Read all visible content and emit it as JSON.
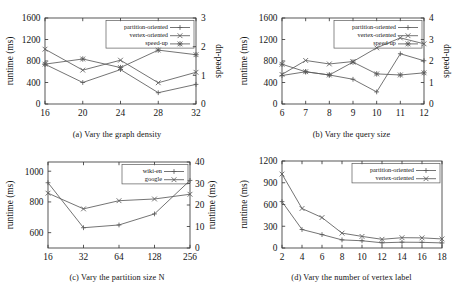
{
  "figure": {
    "panels": [
      "a",
      "b",
      "c",
      "d"
    ]
  },
  "chart_data": [
    {
      "id": "a",
      "type": "line",
      "title": "(a) Vary the graph density",
      "xlabel": "",
      "ylabel": "runtime (ms)",
      "y2label": "speed-up",
      "x": [
        16,
        20,
        24,
        28,
        32
      ],
      "xticklabels": [
        "16",
        "20",
        "24",
        "28",
        "32"
      ],
      "ylim": [
        0,
        1600
      ],
      "yticks": [
        0,
        400,
        800,
        1200,
        1600
      ],
      "yticklabels": [
        "0",
        "400",
        "800",
        "1200",
        "1600"
      ],
      "y2lim": [
        0,
        3
      ],
      "y2ticks": [
        0,
        1,
        2,
        3
      ],
      "y2ticklabels": [
        "0",
        "1",
        "2",
        "3"
      ],
      "grid": false,
      "legend_position": "top-right",
      "series": [
        {
          "name": "partition-oriented",
          "axis": "left",
          "marker": "plus",
          "values": [
            740,
            400,
            640,
            210,
            365
          ]
        },
        {
          "name": "vertex-oriented",
          "axis": "left",
          "marker": "cross",
          "values": [
            1020,
            630,
            815,
            395,
            590
          ]
        },
        {
          "name": "speed-up",
          "axis": "right",
          "marker": "star",
          "values": [
            1.39,
            1.57,
            1.27,
            1.88,
            1.72
          ]
        }
      ]
    },
    {
      "id": "b",
      "type": "line",
      "title": "(b) Vary the query size",
      "xlabel": "",
      "ylabel": "runtime (ms)",
      "y2label": "speed-up",
      "x": [
        6,
        7,
        8,
        9,
        10,
        11,
        12
      ],
      "xticklabels": [
        "6",
        "7",
        "8",
        "9",
        "10",
        "11",
        "12"
      ],
      "ylim": [
        0,
        1600
      ],
      "yticks": [
        0,
        400,
        800,
        1200,
        1600
      ],
      "yticklabels": [
        "0",
        "400",
        "800",
        "1200",
        "1600"
      ],
      "y2lim": [
        0,
        4
      ],
      "y2ticks": [
        0,
        1,
        2,
        3,
        4
      ],
      "y2ticklabels": [
        "0",
        "1",
        "2",
        "3",
        "4"
      ],
      "grid": false,
      "legend_position": "top-right",
      "series": [
        {
          "name": "partition-oriented",
          "axis": "left",
          "marker": "plus",
          "values": [
            530,
            600,
            540,
            460,
            225,
            935,
            805
          ]
        },
        {
          "name": "vertex-oriented",
          "axis": "left",
          "marker": "cross",
          "values": [
            550,
            810,
            745,
            790,
            1045,
            1230,
            1120
          ]
        },
        {
          "name": "speed-up",
          "axis": "right",
          "marker": "star",
          "values": [
            1.85,
            1.5,
            1.35,
            1.95,
            1.4,
            1.35,
            1.45
          ]
        }
      ]
    },
    {
      "id": "c",
      "type": "line",
      "title": "(c) Vary the partition size N",
      "xlabel": "",
      "ylabel": "runtime (ms)",
      "y2label": "runtime (ms)",
      "x": [
        16,
        32,
        64,
        128,
        256
      ],
      "xticklabels": [
        "16",
        "32",
        "64",
        "128",
        "256"
      ],
      "ylim": [
        500,
        1060
      ],
      "yticks": [
        600,
        800,
        1000
      ],
      "yticklabels": [
        "600",
        "800",
        "1000"
      ],
      "y2lim": [
        0,
        40
      ],
      "y2ticks": [
        0,
        10,
        20,
        30,
        40
      ],
      "y2ticklabels": [
        "0",
        "10",
        "20",
        "30",
        "40"
      ],
      "grid": false,
      "legend_position": "top-right",
      "series": [
        {
          "name": "wiki-en",
          "axis": "left",
          "marker": "plus",
          "values": [
            925,
            632,
            650,
            722,
            940
          ]
        },
        {
          "name": "google",
          "axis": "right",
          "marker": "cross",
          "values": [
            25.5,
            18.2,
            22.0,
            22.8,
            25.0
          ]
        }
      ]
    },
    {
      "id": "d",
      "type": "line",
      "title": "(d) Vary the number of vertex label",
      "xlabel": "",
      "ylabel": "runtime (ms)",
      "y2label": "",
      "x": [
        2,
        4,
        6,
        8,
        10,
        12,
        14,
        16,
        18
      ],
      "xticklabels": [
        "2",
        "4",
        "6",
        "8",
        "10",
        "12",
        "14",
        "16",
        "18"
      ],
      "ylim": [
        0,
        1200
      ],
      "yticks": [
        0,
        300,
        600,
        900,
        1200
      ],
      "yticklabels": [
        "0",
        "300",
        "600",
        "900",
        "1200"
      ],
      "grid": false,
      "legend_position": "top-right",
      "series": [
        {
          "name": "partition-oriented",
          "axis": "left",
          "marker": "plus",
          "values": [
            640,
            255,
            185,
            112,
            100,
            72,
            80,
            78,
            70
          ]
        },
        {
          "name": "vertex-oriented",
          "axis": "left",
          "marker": "cross",
          "values": [
            1020,
            545,
            420,
            205,
            160,
            120,
            142,
            140,
            125
          ]
        }
      ]
    }
  ]
}
